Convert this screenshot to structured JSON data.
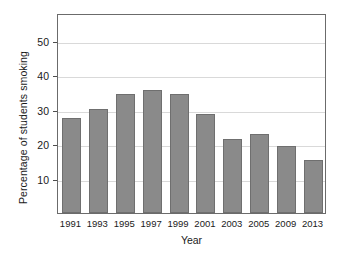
{
  "chart_data": {
    "type": "bar",
    "title": "",
    "xlabel": "Year",
    "ylabel": "Percentage of students smoking",
    "categories": [
      "1991",
      "1993",
      "1995",
      "1997",
      "1999",
      "2001",
      "2003",
      "2005",
      "2009",
      "2013"
    ],
    "values": [
      27.5,
      30.3,
      34.6,
      35.7,
      34.6,
      28.6,
      21.6,
      22.8,
      19.3,
      15.3
    ],
    "ylim": [
      0,
      58
    ],
    "yticks": [
      10,
      20,
      30,
      40,
      50
    ],
    "ytick_labels": [
      "10",
      "20",
      "30",
      "40",
      "50"
    ],
    "grid": "horizontal",
    "legend": "none",
    "bar_color": "#8a8a8a",
    "bar_edge_color": "#6f6f6f",
    "gridline_color": "#d9d9d9",
    "frame_color": "#6b6b6b",
    "background": "#ffffff"
  }
}
